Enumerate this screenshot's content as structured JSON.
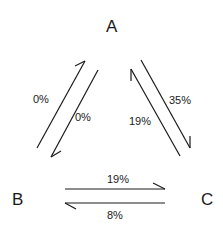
{
  "diagram": {
    "type": "transition-diagram",
    "nodes": [
      {
        "id": "A",
        "label": "A"
      },
      {
        "id": "B",
        "label": "B"
      },
      {
        "id": "C",
        "label": "C"
      }
    ],
    "edges": [
      {
        "from": "B",
        "to": "A",
        "label": "0%"
      },
      {
        "from": "A",
        "to": "B",
        "label": "0%"
      },
      {
        "from": "A",
        "to": "C",
        "label": "35%"
      },
      {
        "from": "C",
        "to": "A",
        "label": "19%"
      },
      {
        "from": "B",
        "to": "C",
        "label": "19%"
      },
      {
        "from": "C",
        "to": "B",
        "label": "8%"
      }
    ],
    "colors": {
      "ink": "#1a1a1a",
      "background": "#ffffff"
    }
  }
}
